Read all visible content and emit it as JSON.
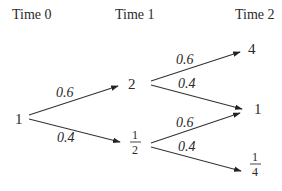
{
  "diagram": {
    "type": "binomial-tree",
    "time_labels": [
      "Time 0",
      "Time 1",
      "Time 2"
    ],
    "nodes": {
      "t0": "1",
      "t1_up": "2",
      "t1_down": {
        "numerator": "1",
        "denominator": "2"
      },
      "t2_upup": "4",
      "t2_mid": "1",
      "t2_downdown": {
        "numerator": "1",
        "denominator": "4"
      }
    },
    "edges": [
      {
        "from": "t0",
        "to": "t1_up",
        "prob": "0.6"
      },
      {
        "from": "t0",
        "to": "t1_down",
        "prob": "0.4"
      },
      {
        "from": "t1_up",
        "to": "t2_upup",
        "prob": "0.6"
      },
      {
        "from": "t1_up",
        "to": "t2_mid",
        "prob": "0.4"
      },
      {
        "from": "t1_down",
        "to": "t2_mid",
        "prob": "0.6"
      },
      {
        "from": "t1_down",
        "to": "t2_downdown",
        "prob": "0.4"
      }
    ],
    "colors": {
      "ink": "#2a2a2a",
      "background": "#ffffff"
    }
  }
}
